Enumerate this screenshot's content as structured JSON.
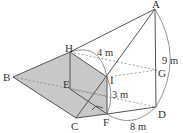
{
  "diagram": {
    "type": "geometry-3d",
    "colors": {
      "stroke": "#555555",
      "shade": "#c8c8c8",
      "dashed": "#888888",
      "text": "#333333"
    },
    "points": {
      "A": {
        "label": "A",
        "x": 155,
        "y": 9
      },
      "H": {
        "label": "H",
        "x": 70,
        "y": 52
      },
      "B": {
        "label": "B",
        "x": 13,
        "y": 77
      },
      "E": {
        "label": "E",
        "x": 70,
        "y": 89
      },
      "I": {
        "label": "I",
        "x": 107,
        "y": 77
      },
      "G": {
        "label": "G",
        "x": 157,
        "y": 70
      },
      "C": {
        "label": "C",
        "x": 76,
        "y": 118
      },
      "F": {
        "label": "F",
        "x": 107,
        "y": 114
      },
      "D": {
        "label": "D",
        "x": 156,
        "y": 107
      }
    },
    "measurements": {
      "HI": "4 m",
      "IF": "3 m",
      "AD": "9 m",
      "FD": "8 m"
    }
  }
}
